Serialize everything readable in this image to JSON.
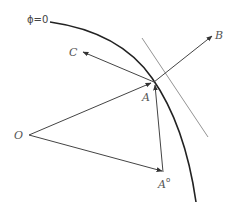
{
  "diagram": {
    "labels": {
      "phi": "ϕ=0",
      "B": "B",
      "C": "C",
      "A": "A",
      "O": "O",
      "A0": "A",
      "A0_sup": "o"
    },
    "points": {
      "O": [
        27,
        135
      ],
      "A": [
        154,
        82
      ],
      "A0": [
        163,
        172
      ],
      "B": [
        212,
        35
      ],
      "C": [
        82,
        52
      ]
    },
    "colors": {
      "curve": "#222222",
      "tangent": "#888888",
      "vectors": "#444444",
      "labels": "#555555"
    }
  }
}
